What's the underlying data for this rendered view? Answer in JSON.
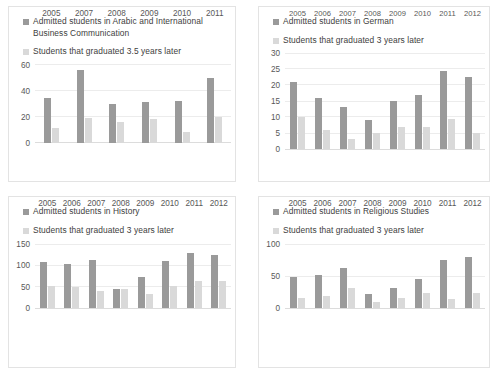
{
  "chart_data": [
    {
      "id": "arabic-international-business-communication",
      "type": "bar",
      "title": "",
      "xlabel": "",
      "ylabel": "",
      "ylim": [
        0,
        60
      ],
      "yticks": [
        0,
        20,
        40,
        60
      ],
      "grid": true,
      "legend_position": "top-left",
      "categories": [
        "2005",
        "2007",
        "2008",
        "2009",
        "2010",
        "2011"
      ],
      "series": [
        {
          "name": "Admitted students in Arabic and International Business Communication",
          "color": "#9a9a9a",
          "values": [
            34,
            56,
            30,
            31,
            32,
            50
          ]
        },
        {
          "name": "Students that graduated 3.5 years later",
          "color": "#d9d9d9",
          "values": [
            11,
            19,
            16,
            18,
            8,
            20
          ]
        }
      ]
    },
    {
      "id": "german",
      "type": "bar",
      "title": "",
      "xlabel": "",
      "ylabel": "",
      "ylim": [
        0,
        30
      ],
      "yticks": [
        0,
        5,
        10,
        15,
        20,
        25,
        30
      ],
      "grid": true,
      "legend_position": "top-left",
      "categories": [
        "2005",
        "2006",
        "2007",
        "2008",
        "2009",
        "2010",
        "2011",
        "2012"
      ],
      "series": [
        {
          "name": "Admitted students in German",
          "color": "#9a9a9a",
          "values": [
            21,
            16,
            13,
            9,
            15,
            17,
            24.5,
            22.5
          ]
        },
        {
          "name": "Students that graduated 3 years later",
          "color": "#d9d9d9",
          "values": [
            10,
            6,
            3,
            5,
            7,
            7,
            9.5,
            5
          ]
        }
      ]
    },
    {
      "id": "history",
      "type": "bar",
      "title": "",
      "xlabel": "",
      "ylabel": "",
      "ylim": [
        0,
        150
      ],
      "yticks": [
        0,
        50,
        100,
        150
      ],
      "grid": true,
      "legend_position": "top-left",
      "categories": [
        "2005",
        "2006",
        "2007",
        "2008",
        "2009",
        "2010",
        "2011",
        "2012"
      ],
      "series": [
        {
          "name": "Admitted students in History",
          "color": "#9a9a9a",
          "values": [
            107,
            103,
            113,
            44,
            73,
            111,
            130,
            125
          ]
        },
        {
          "name": "Students that graduated 3 years later",
          "color": "#d9d9d9",
          "values": [
            52,
            50,
            39,
            44,
            32,
            52,
            64,
            64
          ]
        }
      ]
    },
    {
      "id": "religious-studies",
      "type": "bar",
      "title": "",
      "xlabel": "",
      "ylabel": "",
      "ylim": [
        0,
        100
      ],
      "yticks": [
        0,
        50,
        100
      ],
      "grid": true,
      "legend_position": "top-left",
      "categories": [
        "2005",
        "2006",
        "2007",
        "2008",
        "2009",
        "2010",
        "2011",
        "2012"
      ],
      "series": [
        {
          "name": "Admitted students in Religious Studies",
          "color": "#9a9a9a",
          "values": [
            49,
            52,
            62,
            22,
            32,
            46,
            75,
            79
          ]
        },
        {
          "name": "Students that graduated 3 years later",
          "color": "#d9d9d9",
          "values": [
            16,
            19,
            32,
            9,
            16,
            23,
            14,
            23
          ]
        }
      ]
    }
  ]
}
